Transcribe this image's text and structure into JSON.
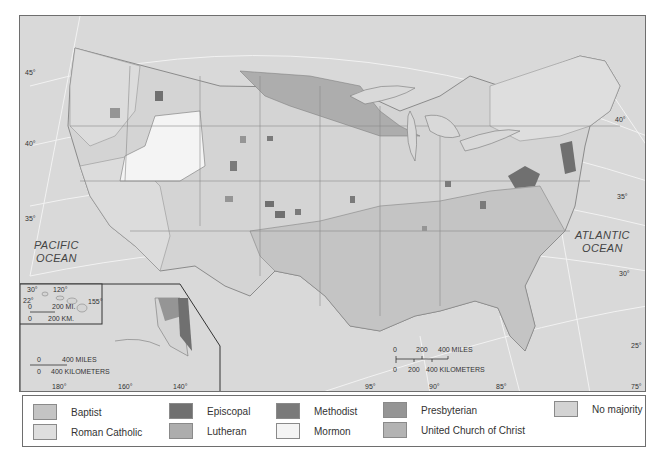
{
  "map": {
    "oceans": {
      "pacific": [
        "PACIFIC",
        "OCEAN"
      ],
      "atlantic": [
        "ATLANTIC",
        "OCEAN"
      ]
    },
    "latitude_labels": {
      "lat45": "45°",
      "lat40_west": "40°",
      "lat35_west": "35°",
      "lat30_west": "30°",
      "lat40_east": "40°",
      "lat35_east": "35°",
      "lat30_east": "30°",
      "lat25_east": "25°",
      "hawaii_lat22": "22°"
    },
    "longitude_labels": {
      "lon120": "120°",
      "lon155": "155°",
      "lon180": "180°",
      "lon160": "160°",
      "lon140": "140°",
      "lon95": "95°",
      "lon90": "90°",
      "lon85": "85°",
      "lon75": "75°"
    },
    "main_scale": {
      "miles_ticks": [
        "0",
        "200",
        "400 MILES"
      ],
      "km_ticks": [
        "0",
        "200",
        "400 KILOMETERS"
      ]
    },
    "hawaii_scale": {
      "miles_ticks": [
        "0",
        "200 MI."
      ],
      "km_ticks": [
        "0",
        "200 KM."
      ]
    },
    "alaska_scale": {
      "miles_ticks": [
        "0",
        "400 MILES"
      ],
      "km_ticks": [
        "0",
        "400 KILOMETERS"
      ]
    }
  },
  "legend": {
    "items": [
      {
        "label": "Baptist",
        "color": "#c4c4c4"
      },
      {
        "label": "Roman Catholic",
        "color": "#dedede"
      },
      {
        "label": "Episcopal",
        "color": "#707070"
      },
      {
        "label": "Lutheran",
        "color": "#adadad"
      },
      {
        "label": "Methodist",
        "color": "#7a7a7a"
      },
      {
        "label": "Mormon",
        "color": "#f4f4f4"
      },
      {
        "label": "Presbyterian",
        "color": "#959595"
      },
      {
        "label": "United Church of Christ",
        "color": "#b3b3b3"
      },
      {
        "label": "No majority",
        "color": "#d3d3d3"
      }
    ]
  }
}
